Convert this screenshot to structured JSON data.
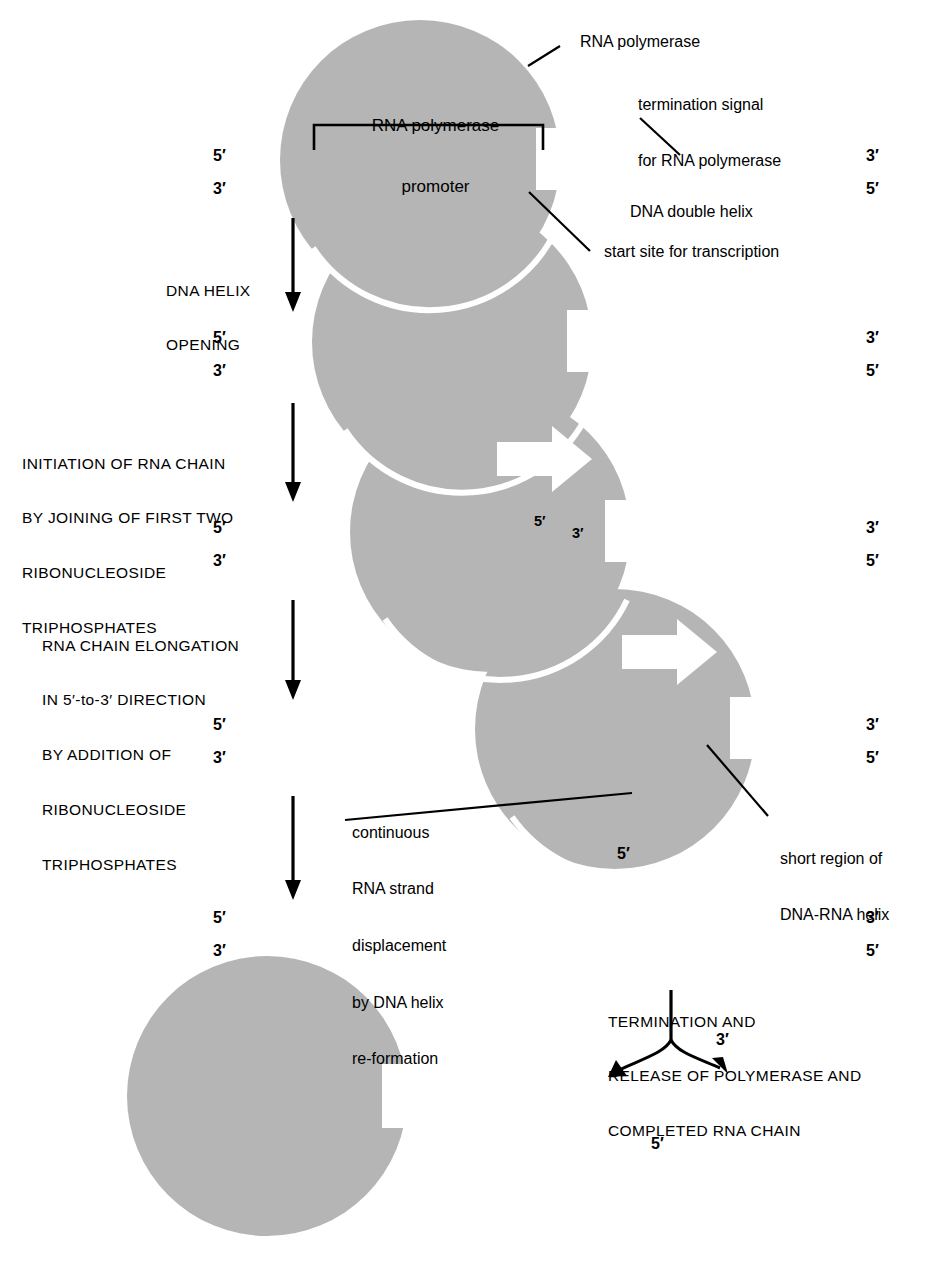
{
  "figure": {
    "colors": {
      "polymerase_gray": "#b5b5b5",
      "ink": "#000000",
      "background": "#ffffff"
    }
  },
  "labels": {
    "rna_polymerase": "RNA polymerase",
    "promoter": "RNA polymerase\npromoter",
    "promoter_line1": "RNA polymerase",
    "promoter_line2": "promoter",
    "termination_signal": "termination signal\nfor RNA polymerase",
    "termination_signal_line1": "termination signal",
    "termination_signal_line2": "for RNA polymerase",
    "dna_double_helix": "DNA double helix",
    "start_site": "start site for transcription",
    "short_region": "short region of\nDNA-RNA helix",
    "short_region_line1": "short region of",
    "short_region_line2": "DNA-RNA helix",
    "continuous_displacement_line1": "continuous",
    "continuous_displacement_line2": "RNA strand",
    "continuous_displacement_line3": "displacement",
    "continuous_displacement_line4": "by DNA helix",
    "continuous_displacement_line5": "re-formation"
  },
  "steps": [
    {
      "id": "dna-helix-opening",
      "line1": "DNA HELIX",
      "line2": "OPENING",
      "line3": "",
      "line4": "",
      "line5": ""
    },
    {
      "id": "initiation-of-rna-chain",
      "line1": "INITIATION OF RNA CHAIN",
      "line2": "BY JOINING OF FIRST TWO",
      "line3": "RIBONUCLEOSIDE",
      "line4": "TRIPHOSPHATES",
      "line5": ""
    },
    {
      "id": "rna-chain-elongation",
      "line1": "RNA CHAIN ELONGATION",
      "line2": "IN 5′-to-3′ DIRECTION",
      "line3": "BY ADDITION OF",
      "line4": "RIBONUCLEOSIDE",
      "line5": "TRIPHOSPHATES"
    },
    {
      "id": "termination-and-release",
      "line1": "TERMINATION AND",
      "line2": "RELEASE OF POLYMERASE AND",
      "line3": "COMPLETED RNA CHAIN",
      "line4": "",
      "line5": ""
    }
  ],
  "primes": {
    "five": "5′",
    "three": "3′"
  },
  "rows": [
    {
      "id": "row-1-closed-duplex",
      "left_top": "5′",
      "left_bottom": "3′",
      "right_top": "3′",
      "right_bottom": "5′"
    },
    {
      "id": "row-2-helix-open",
      "left_top": "5′",
      "left_bottom": "3′",
      "right_top": "3′",
      "right_bottom": "5′"
    },
    {
      "id": "row-3-initiation",
      "left_top": "5′",
      "left_bottom": "3′",
      "right_top": "3′",
      "right_bottom": "5′",
      "rna_five": "5′",
      "rna_three": "3′"
    },
    {
      "id": "row-4-elongation",
      "left_top": "5′",
      "left_bottom": "3′",
      "right_top": "3′",
      "right_bottom": "5′",
      "rna_five": "5′"
    },
    {
      "id": "row-5-terminated",
      "left_top": "5′",
      "left_bottom": "3′",
      "right_top": "3′",
      "right_bottom": "5′"
    }
  ],
  "released_rna": {
    "three_prime": "3′",
    "five_prime": "5′"
  }
}
